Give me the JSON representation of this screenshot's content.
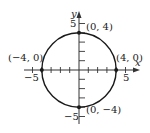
{
  "figure": {
    "type": "circle-graph",
    "equation_implied": "x^2 + y^2 = 16",
    "axes": {
      "x_label": "x",
      "y_label": "y",
      "x_range": [
        -5,
        5
      ],
      "y_range": [
        -5,
        5
      ],
      "tick_step": 1,
      "x_tick_labels": [
        {
          "value": -5,
          "text": "−5"
        },
        {
          "value": 5,
          "text": "5"
        }
      ],
      "y_tick_labels": [
        {
          "value": 5,
          "text": "5"
        },
        {
          "value": -5,
          "text": "−5"
        }
      ]
    },
    "circle": {
      "center": [
        0,
        0
      ],
      "radius": 4,
      "stroke": "#1a1a1a"
    },
    "points": [
      {
        "x": 0,
        "y": 4,
        "label": "(0, 4)"
      },
      {
        "x": 4,
        "y": 0,
        "label": "(4, 0)"
      },
      {
        "x": 0,
        "y": -4,
        "label": "(0, −4)"
      },
      {
        "x": -4,
        "y": 0,
        "label": "(−4, 0)"
      }
    ],
    "colors": {
      "ink": "#1a1a1a",
      "axis": "#333333",
      "background": "#ffffff"
    }
  }
}
